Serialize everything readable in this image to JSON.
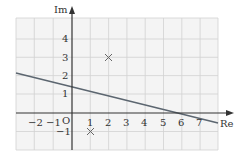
{
  "diagram": {
    "type": "argand-diagram",
    "axes": {
      "x_label": "Re",
      "y_label": "Im",
      "origin_label": "O",
      "x_ticks": [
        "−2",
        "−1",
        "1",
        "2",
        "3",
        "4",
        "5",
        "6",
        "7"
      ],
      "y_ticks": [
        "4",
        "3",
        "2",
        "1",
        "−1"
      ]
    },
    "grid": {
      "x_range": [
        -3,
        8
      ],
      "y_range": [
        -2,
        5
      ]
    },
    "points": [
      {
        "marker": "cross",
        "re": 2,
        "im": 3
      },
      {
        "marker": "cross",
        "re": 1,
        "im": -1
      }
    ],
    "line": {
      "through": [
        [
          -3,
          2.15
        ],
        [
          0,
          1.45
        ],
        [
          5.7,
          0
        ],
        [
          8,
          -0.55
        ]
      ]
    },
    "colors": {
      "grid": "#d4d4d4",
      "axis": "#333333",
      "line": "#5c6670",
      "background": "#f3f3f3"
    }
  }
}
